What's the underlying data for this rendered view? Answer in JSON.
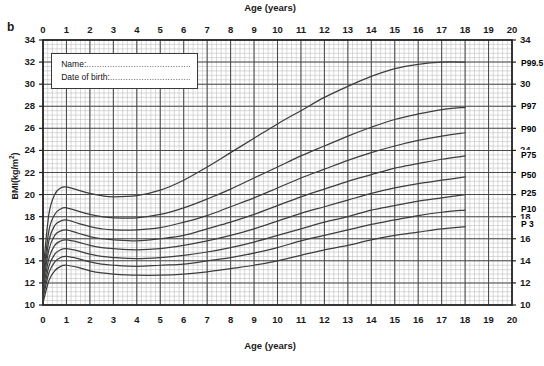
{
  "panel": {
    "label": "b"
  },
  "axes": {
    "x_title_top": "Age (years)",
    "x_title_bottom": "Age (years)",
    "y_title": "BMI(kg/m",
    "y_title_sup": "2",
    "y_title_close": ")",
    "x_ticks": [
      "0",
      "1",
      "2",
      "3",
      "4",
      "5",
      "6",
      "7",
      "8",
      "9",
      "10",
      "11",
      "12",
      "13",
      "14",
      "15",
      "16",
      "17",
      "18",
      "19",
      "20"
    ],
    "y_ticks": [
      "34",
      "32",
      "30",
      "28",
      "26",
      "24",
      "22",
      "20",
      "18",
      "16",
      "14",
      "12",
      "10"
    ]
  },
  "info_box": {
    "name_label": "Name:",
    "name_dots": "...........................................",
    "dob_label": "Date of birth:",
    "dob_dots": "..............................."
  },
  "colors": {
    "curve": "#3d3d3d",
    "grid_minor": "#b9b9b9",
    "grid_major": "#4a4a4a",
    "axis": "#1f1f1f",
    "text": "#141414",
    "background": "#ffffff"
  },
  "chart_data": {
    "type": "line",
    "title": "",
    "xlabel": "Age (years)",
    "ylabel": "BMI(kg/m2)",
    "xlim": [
      0,
      20
    ],
    "ylim": [
      10,
      34
    ],
    "grid": true,
    "x_major_step": 1,
    "x_minor_step": 0.2,
    "y_major_step": 2,
    "y_minor_step": 0.4,
    "legend": "inline-right",
    "x": [
      0,
      0.25,
      0.5,
      0.75,
      1,
      1.5,
      2,
      2.5,
      3,
      4,
      5,
      6,
      7,
      8,
      9,
      10,
      11,
      12,
      13,
      14,
      15,
      16,
      17,
      18,
      19,
      20
    ],
    "series": [
      {
        "name": "P99.5",
        "label": "P99.5",
        "label_y": 31.9,
        "values": [
          13.0,
          18.2,
          20.0,
          20.6,
          20.7,
          20.4,
          20.1,
          19.9,
          19.8,
          19.9,
          20.4,
          21.3,
          22.5,
          23.8,
          25.1,
          26.4,
          27.6,
          28.8,
          29.8,
          30.7,
          31.4,
          31.8,
          32.0,
          32.0,
          null,
          null
        ]
      },
      {
        "name": "P97",
        "label": "P97",
        "label_y": 28.0,
        "values": [
          12.4,
          16.7,
          18.2,
          18.7,
          18.8,
          18.5,
          18.2,
          18.0,
          17.9,
          17.9,
          18.2,
          18.8,
          19.6,
          20.5,
          21.5,
          22.5,
          23.5,
          24.4,
          25.3,
          26.1,
          26.8,
          27.3,
          27.7,
          27.9,
          null,
          null
        ]
      },
      {
        "name": "P90",
        "label": "P90",
        "label_y": 25.9,
        "values": [
          12.0,
          15.8,
          17.2,
          17.6,
          17.7,
          17.4,
          17.1,
          16.9,
          16.8,
          16.8,
          17.0,
          17.5,
          18.1,
          18.9,
          19.7,
          20.6,
          21.5,
          22.3,
          23.1,
          23.8,
          24.4,
          24.9,
          25.3,
          25.6,
          null,
          null
        ]
      },
      {
        "name": "P75",
        "label": "P75",
        "label_y": 23.6,
        "values": [
          11.7,
          15.0,
          16.3,
          16.7,
          16.8,
          16.5,
          16.2,
          16.0,
          15.9,
          15.8,
          16.0,
          16.3,
          16.9,
          17.5,
          18.2,
          19.0,
          19.8,
          20.5,
          21.2,
          21.8,
          22.4,
          22.8,
          23.2,
          23.5,
          null,
          null
        ]
      },
      {
        "name": "P50",
        "label": "P50",
        "label_y": 21.8,
        "values": [
          11.3,
          14.2,
          15.4,
          15.8,
          15.9,
          15.7,
          15.4,
          15.2,
          15.1,
          15.0,
          15.1,
          15.4,
          15.8,
          16.3,
          16.9,
          17.6,
          18.3,
          18.9,
          19.5,
          20.1,
          20.6,
          21.0,
          21.3,
          21.6,
          null,
          null
        ]
      },
      {
        "name": "P25",
        "label": "P25",
        "label_y": 20.1,
        "values": [
          10.9,
          13.5,
          14.6,
          15.0,
          15.1,
          14.9,
          14.6,
          14.4,
          14.3,
          14.2,
          14.3,
          14.5,
          14.8,
          15.2,
          15.7,
          16.3,
          16.9,
          17.5,
          18.0,
          18.6,
          19.0,
          19.4,
          19.7,
          20.0,
          null,
          null
        ]
      },
      {
        "name": "P10",
        "label": "P10",
        "label_y": 18.7,
        "values": [
          10.6,
          12.9,
          13.9,
          14.3,
          14.4,
          14.2,
          13.9,
          13.7,
          13.6,
          13.5,
          13.6,
          13.7,
          14.0,
          14.3,
          14.7,
          15.2,
          15.8,
          16.3,
          16.8,
          17.3,
          17.7,
          18.1,
          18.4,
          18.6,
          null,
          null
        ]
      },
      {
        "name": "P3",
        "label": "P 3",
        "label_y": 17.3,
        "values": [
          10.2,
          12.2,
          13.1,
          13.5,
          13.6,
          13.4,
          13.1,
          12.9,
          12.8,
          12.7,
          12.7,
          12.8,
          13.0,
          13.3,
          13.6,
          14.0,
          14.5,
          15.0,
          15.4,
          15.9,
          16.3,
          16.6,
          16.9,
          17.1,
          null,
          null
        ]
      }
    ]
  }
}
